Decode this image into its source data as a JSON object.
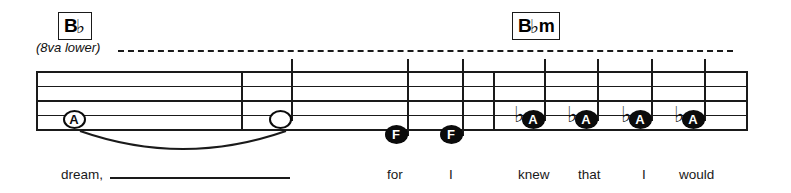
{
  "sheet": {
    "width": 791,
    "height": 193,
    "background": "#ffffff",
    "ink_color": "#1a1a1a"
  },
  "ottava": {
    "label": "(8va lower)",
    "dash_start_x": 118,
    "dash_end_x": 733
  },
  "chords": [
    {
      "name": "chord-bb",
      "root": "B",
      "accidental": "♭",
      "quality": "",
      "display": "B♭",
      "x": 58,
      "y": 12
    },
    {
      "name": "chord-bbm",
      "root": "B",
      "accidental": "♭",
      "quality": "m",
      "display": "B♭m",
      "x": 512,
      "y": 12
    }
  ],
  "staff": {
    "top_y": 71,
    "line_gap": 14.5,
    "line_count": 5,
    "left_x": 36,
    "right_x": 748,
    "barlines": [
      241,
      493
    ]
  },
  "notes": [
    {
      "name": "note-a-whole",
      "letter": "A",
      "pitch": "A",
      "head": "open",
      "duration": "whole",
      "accidental": "",
      "stem": false,
      "x": 74,
      "y": 119,
      "lyric": "dream,"
    },
    {
      "name": "note-tied-half",
      "letter": "",
      "pitch": "A",
      "head": "open",
      "duration": "half",
      "accidental": "",
      "stem": true,
      "x": 280,
      "y": 119,
      "lyric": ""
    },
    {
      "name": "note-f-1",
      "letter": "F",
      "pitch": "F",
      "head": "filled",
      "duration": "quarter",
      "accidental": "",
      "stem": true,
      "x": 396,
      "y": 134,
      "lyric": "for"
    },
    {
      "name": "note-f-2",
      "letter": "F",
      "pitch": "F",
      "head": "filled",
      "duration": "quarter",
      "accidental": "",
      "stem": true,
      "x": 451,
      "y": 134,
      "lyric": "I"
    },
    {
      "name": "note-ab-1",
      "letter": "A",
      "pitch": "Ab",
      "head": "filled",
      "duration": "quarter",
      "accidental": "♭",
      "stem": true,
      "x": 533,
      "y": 119,
      "lyric": "knew"
    },
    {
      "name": "note-ab-2",
      "letter": "A",
      "pitch": "Ab",
      "head": "filled",
      "duration": "quarter",
      "accidental": "♭",
      "stem": true,
      "x": 586,
      "y": 119,
      "lyric": "that"
    },
    {
      "name": "note-ab-3",
      "letter": "A",
      "pitch": "Ab",
      "head": "filled",
      "duration": "quarter",
      "accidental": "♭",
      "stem": true,
      "x": 640,
      "y": 119,
      "lyric": "I"
    },
    {
      "name": "note-ab-4",
      "letter": "A",
      "pitch": "Ab",
      "head": "filled",
      "duration": "quarter",
      "accidental": "♭",
      "stem": true,
      "x": 693,
      "y": 119,
      "lyric": "would"
    }
  ],
  "slur": {
    "name": "tie-slur",
    "start_x": 80,
    "end_x": 286,
    "y": 131,
    "sag": 18
  },
  "lyrics": [
    {
      "name": "lyric-dream",
      "text": "dream,",
      "x": 61,
      "y": 167,
      "melisma": {
        "x": 110,
        "y": 177,
        "width": 180
      }
    },
    {
      "name": "lyric-for",
      "text": "for",
      "x": 387,
      "y": 167,
      "melisma": null
    },
    {
      "name": "lyric-i-1",
      "text": "I",
      "x": 449,
      "y": 167,
      "melisma": null
    },
    {
      "name": "lyric-knew",
      "text": "knew",
      "x": 518,
      "y": 167,
      "melisma": null
    },
    {
      "name": "lyric-that",
      "text": "that",
      "x": 578,
      "y": 167,
      "melisma": null
    },
    {
      "name": "lyric-i-2",
      "text": "I",
      "x": 642,
      "y": 167,
      "melisma": null
    },
    {
      "name": "lyric-would",
      "text": "would",
      "x": 679,
      "y": 167,
      "melisma": null
    }
  ]
}
